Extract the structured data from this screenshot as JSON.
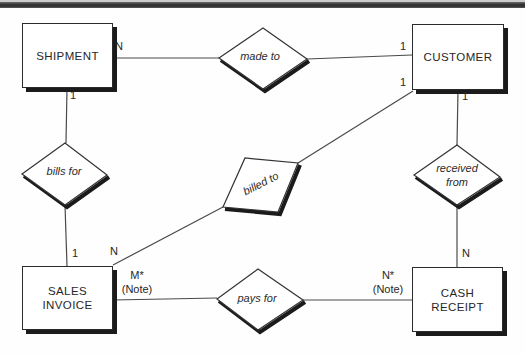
{
  "colors": {
    "background": "#ffffff",
    "top_bar": "#353535",
    "ink": "#272727",
    "line": "#4a4a4a",
    "shadow": "#1b1b1b"
  },
  "diagram": {
    "type": "entity-relationship-diagram",
    "entities": [
      {
        "name": "SHIPMENT"
      },
      {
        "name": "CUSTOMER"
      },
      {
        "name": "SALES\nINVOICE"
      },
      {
        "name": "CASH\nRECEIPT"
      }
    ],
    "relationships": [
      {
        "label": "made to",
        "from": "SHIPMENT",
        "from_cardinality": "N",
        "to": "CUSTOMER",
        "to_cardinality": "1"
      },
      {
        "label": "bills for",
        "from": "SHIPMENT",
        "from_cardinality": "1",
        "to": "SALES INVOICE",
        "to_cardinality": "1"
      },
      {
        "label": "billed to",
        "from": "CUSTOMER",
        "from_cardinality": "1",
        "to": "SALES INVOICE",
        "to_cardinality": "N"
      },
      {
        "label": "received\nfrom",
        "from": "CUSTOMER",
        "from_cardinality": "1",
        "to": "CASH RECEIPT",
        "to_cardinality": "N"
      },
      {
        "label": "pays for",
        "from": "SALES INVOICE",
        "from_cardinality": "M*\n(Note)",
        "to": "CASH RECEIPT",
        "to_cardinality": "N*\n(Note)"
      }
    ]
  }
}
